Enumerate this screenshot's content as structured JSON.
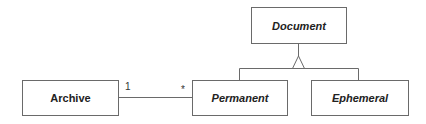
{
  "diagram": {
    "type": "UML class diagram",
    "classes": [
      {
        "id": "document",
        "name": "Document",
        "abstract": true
      },
      {
        "id": "archive",
        "name": "Archive",
        "abstract": false
      },
      {
        "id": "permanent",
        "name": "Permanent",
        "abstract": true
      },
      {
        "id": "ephemeral",
        "name": "Ephemeral",
        "abstract": true
      }
    ],
    "relationships": [
      {
        "type": "generalization",
        "parent": "Document",
        "children": [
          "Permanent",
          "Ephemeral"
        ]
      },
      {
        "type": "association",
        "from": "Archive",
        "to": "Permanent",
        "from_multiplicity": "1",
        "to_multiplicity": "*"
      }
    ],
    "multiplicities": {
      "archive_end": "1",
      "permanent_end": "*"
    },
    "colors": {
      "line": "#6a6a6a",
      "text": "#222222",
      "background": "#ffffff"
    }
  }
}
